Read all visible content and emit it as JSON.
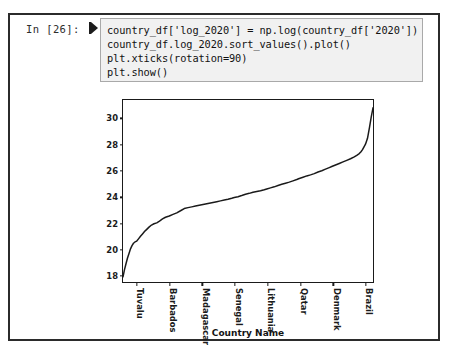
{
  "cell": {
    "prompt_label": "In [26]:",
    "run_marker_icon": "run-cell-icon",
    "code_lines": [
      "country_df['log_2020'] = np.log(country_df['2020'])",
      "country_df.log_2020.sort_values().plot()",
      "plt.xticks(rotation=90)",
      "plt.show()"
    ]
  },
  "chart_data": {
    "type": "line",
    "title": "",
    "xlabel": "Country Name",
    "ylabel": "",
    "ylim": [
      17.4,
      31.4
    ],
    "yticks": [
      18,
      20,
      22,
      24,
      26,
      28,
      30
    ],
    "ytick_labels": [
      "18",
      "20",
      "22",
      "24",
      "26",
      "28",
      "30"
    ],
    "grid": false,
    "legend": false,
    "xtick_labels": [
      "Tuvalu",
      "Barbados",
      "Madagascar",
      "Senegal",
      "Lithuania",
      "Qatar",
      "Denmark",
      "Brazil"
    ],
    "xtick_positions": [
      0.055,
      0.185,
      0.315,
      0.445,
      0.575,
      0.705,
      0.835,
      0.963
    ],
    "line_color": "#1a1a1a",
    "series": [
      {
        "name": "log_2020",
        "x": [
          0.0,
          0.006,
          0.012,
          0.018,
          0.024,
          0.03,
          0.036,
          0.042,
          0.048,
          0.055,
          0.062,
          0.07,
          0.078,
          0.086,
          0.095,
          0.104,
          0.114,
          0.124,
          0.135,
          0.146,
          0.158,
          0.17,
          0.185,
          0.2,
          0.215,
          0.23,
          0.245,
          0.26,
          0.275,
          0.29,
          0.305,
          0.315,
          0.33,
          0.345,
          0.36,
          0.375,
          0.39,
          0.405,
          0.42,
          0.435,
          0.445,
          0.46,
          0.475,
          0.49,
          0.505,
          0.52,
          0.535,
          0.55,
          0.565,
          0.575,
          0.59,
          0.605,
          0.62,
          0.635,
          0.65,
          0.665,
          0.68,
          0.695,
          0.705,
          0.72,
          0.735,
          0.75,
          0.765,
          0.78,
          0.795,
          0.81,
          0.825,
          0.835,
          0.85,
          0.865,
          0.88,
          0.895,
          0.91,
          0.925,
          0.935,
          0.945,
          0.952,
          0.958,
          0.963,
          0.97,
          0.978,
          0.986,
          0.993,
          1.0
        ],
        "values": [
          17.8,
          18.35,
          18.8,
          19.25,
          19.6,
          19.95,
          20.2,
          20.38,
          20.48,
          20.55,
          20.72,
          20.92,
          21.1,
          21.28,
          21.45,
          21.62,
          21.78,
          21.88,
          21.95,
          22.08,
          22.25,
          22.38,
          22.48,
          22.6,
          22.72,
          22.88,
          23.05,
          23.12,
          23.18,
          23.24,
          23.3,
          23.34,
          23.4,
          23.46,
          23.52,
          23.58,
          23.64,
          23.7,
          23.76,
          23.84,
          23.9,
          23.96,
          24.05,
          24.15,
          24.22,
          24.3,
          24.36,
          24.42,
          24.5,
          24.56,
          24.64,
          24.72,
          24.82,
          24.92,
          25.0,
          25.08,
          25.18,
          25.28,
          25.36,
          25.46,
          25.56,
          25.64,
          25.74,
          25.86,
          25.96,
          26.08,
          26.2,
          26.28,
          26.4,
          26.52,
          26.64,
          26.76,
          26.88,
          27.02,
          27.14,
          27.28,
          27.42,
          27.58,
          27.76,
          28.0,
          28.45,
          29.3,
          30.1,
          30.8
        ]
      }
    ]
  }
}
